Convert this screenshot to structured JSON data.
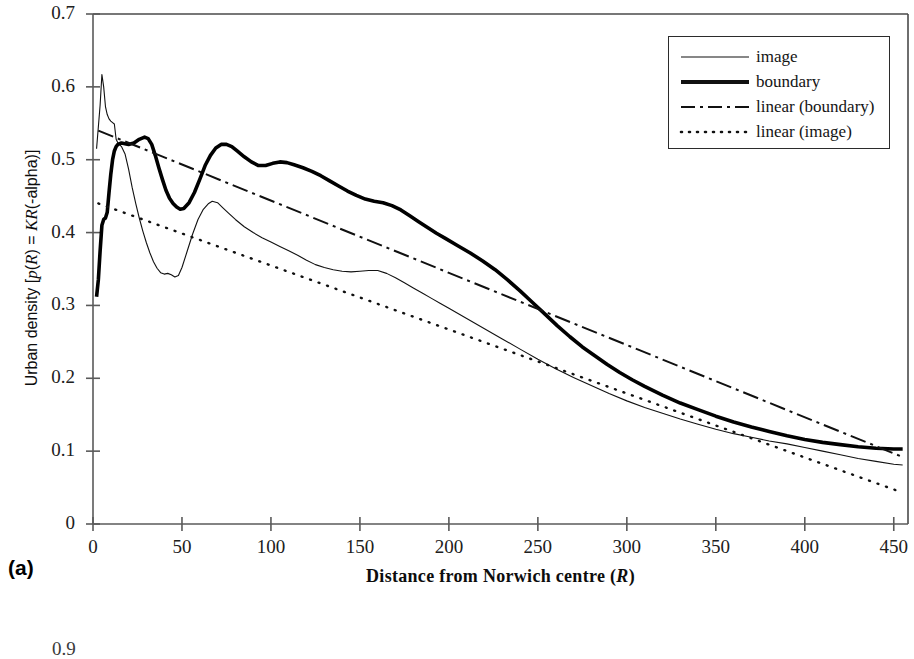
{
  "panel": {
    "label": "(a)"
  },
  "next_figure": {
    "partial_ytick": "0.9"
  },
  "axes": {
    "y_title_prefix": "Urban density [",
    "y_title_p": "p",
    "y_title_mid1": "(",
    "y_title_R1": "R",
    "y_title_mid2": ") = ",
    "y_title_K": "K",
    "y_title_R2": "R",
    "y_title_suffix": "(-alpha)]",
    "x_title_prefix": "Distance from Norwich centre (",
    "x_title_R": "R",
    "x_title_suffix": ")"
  },
  "legend": {
    "items": [
      {
        "label": "image",
        "style": "thin-solid"
      },
      {
        "label": "boundary",
        "style": "thick-solid"
      },
      {
        "label": "linear (boundary)",
        "style": "dash-dot"
      },
      {
        "label": "linear (image)",
        "style": "dotted"
      }
    ]
  },
  "chart_data": {
    "type": "line",
    "title": "",
    "subtitle": "",
    "xlabel": "Distance from Norwich centre (R)",
    "ylabel": "Urban density [p(R) = K R(-alpha)]",
    "xlim": [
      0,
      458
    ],
    "ylim": [
      0,
      0.7
    ],
    "xticks": [
      0,
      50,
      100,
      150,
      200,
      250,
      300,
      350,
      400,
      450
    ],
    "xtick_labels": [
      "0",
      "50",
      "100",
      "150",
      "200",
      "250",
      "300",
      "350",
      "400",
      "450"
    ],
    "yticks": [
      0,
      0.1,
      0.2,
      0.3,
      0.4,
      0.5,
      0.6,
      0.7
    ],
    "ytick_labels": [
      "0",
      "0.1",
      "0.2",
      "0.3",
      "0.4",
      "0.5",
      "0.6",
      "0.7"
    ],
    "grid": false,
    "legend_position": "top-right",
    "series": [
      {
        "name": "image",
        "style": "thin-solid",
        "color": "#111111",
        "width": 1.1,
        "points": [
          [
            2,
            0.515
          ],
          [
            3,
            0.545
          ],
          [
            4,
            0.575
          ],
          [
            5,
            0.617
          ],
          [
            6,
            0.6
          ],
          [
            7,
            0.573
          ],
          [
            8,
            0.562
          ],
          [
            9,
            0.556
          ],
          [
            10,
            0.553
          ],
          [
            11,
            0.551
          ],
          [
            12,
            0.549
          ],
          [
            13,
            0.528
          ],
          [
            14,
            0.523
          ],
          [
            16,
            0.518
          ],
          [
            18,
            0.508
          ],
          [
            20,
            0.487
          ],
          [
            22,
            0.462
          ],
          [
            24,
            0.44
          ],
          [
            26,
            0.42
          ],
          [
            28,
            0.402
          ],
          [
            30,
            0.386
          ],
          [
            32,
            0.372
          ],
          [
            34,
            0.36
          ],
          [
            36,
            0.351
          ],
          [
            38,
            0.345
          ],
          [
            40,
            0.343
          ],
          [
            42,
            0.344
          ],
          [
            44,
            0.342
          ],
          [
            46,
            0.339
          ],
          [
            48,
            0.341
          ],
          [
            50,
            0.352
          ],
          [
            53,
            0.375
          ],
          [
            56,
            0.398
          ],
          [
            59,
            0.418
          ],
          [
            62,
            0.432
          ],
          [
            65,
            0.44
          ],
          [
            67,
            0.443
          ],
          [
            70,
            0.441
          ],
          [
            73,
            0.434
          ],
          [
            76,
            0.427
          ],
          [
            80,
            0.418
          ],
          [
            85,
            0.408
          ],
          [
            90,
            0.4
          ],
          [
            95,
            0.393
          ],
          [
            100,
            0.387
          ],
          [
            105,
            0.381
          ],
          [
            110,
            0.375
          ],
          [
            115,
            0.369
          ],
          [
            120,
            0.362
          ],
          [
            125,
            0.356
          ],
          [
            130,
            0.352
          ],
          [
            135,
            0.349
          ],
          [
            140,
            0.347
          ],
          [
            145,
            0.346
          ],
          [
            150,
            0.347
          ],
          [
            155,
            0.348
          ],
          [
            160,
            0.348
          ],
          [
            165,
            0.344
          ],
          [
            170,
            0.338
          ],
          [
            175,
            0.331
          ],
          [
            180,
            0.324
          ],
          [
            185,
            0.317
          ],
          [
            190,
            0.31
          ],
          [
            195,
            0.303
          ],
          [
            200,
            0.296
          ],
          [
            210,
            0.282
          ],
          [
            220,
            0.268
          ],
          [
            230,
            0.254
          ],
          [
            240,
            0.24
          ],
          [
            250,
            0.226
          ],
          [
            260,
            0.213
          ],
          [
            270,
            0.201
          ],
          [
            280,
            0.19
          ],
          [
            290,
            0.179
          ],
          [
            300,
            0.169
          ],
          [
            310,
            0.16
          ],
          [
            320,
            0.152
          ],
          [
            330,
            0.144
          ],
          [
            340,
            0.137
          ],
          [
            350,
            0.13
          ],
          [
            360,
            0.124
          ],
          [
            370,
            0.119
          ],
          [
            380,
            0.114
          ],
          [
            390,
            0.11
          ],
          [
            400,
            0.105
          ],
          [
            410,
            0.1
          ],
          [
            420,
            0.095
          ],
          [
            430,
            0.09
          ],
          [
            440,
            0.086
          ],
          [
            450,
            0.082
          ],
          [
            455,
            0.081
          ]
        ]
      },
      {
        "name": "boundary",
        "style": "thick-solid",
        "color": "#000000",
        "width": 3.6,
        "points": [
          [
            2,
            0.312
          ],
          [
            3,
            0.335
          ],
          [
            4,
            0.375
          ],
          [
            5,
            0.41
          ],
          [
            6,
            0.418
          ],
          [
            7,
            0.42
          ],
          [
            8,
            0.428
          ],
          [
            9,
            0.455
          ],
          [
            10,
            0.48
          ],
          [
            11,
            0.5
          ],
          [
            12,
            0.512
          ],
          [
            13,
            0.518
          ],
          [
            14,
            0.521
          ],
          [
            16,
            0.523
          ],
          [
            18,
            0.522
          ],
          [
            20,
            0.521
          ],
          [
            23,
            0.523
          ],
          [
            26,
            0.528
          ],
          [
            29,
            0.531
          ],
          [
            31,
            0.529
          ],
          [
            33,
            0.521
          ],
          [
            35,
            0.506
          ],
          [
            37,
            0.489
          ],
          [
            39,
            0.473
          ],
          [
            41,
            0.458
          ],
          [
            43,
            0.447
          ],
          [
            45,
            0.44
          ],
          [
            47,
            0.435
          ],
          [
            49,
            0.432
          ],
          [
            51,
            0.433
          ],
          [
            54,
            0.441
          ],
          [
            57,
            0.455
          ],
          [
            60,
            0.473
          ],
          [
            63,
            0.492
          ],
          [
            66,
            0.506
          ],
          [
            69,
            0.516
          ],
          [
            72,
            0.521
          ],
          [
            75,
            0.521
          ],
          [
            78,
            0.518
          ],
          [
            81,
            0.512
          ],
          [
            85,
            0.504
          ],
          [
            89,
            0.497
          ],
          [
            93,
            0.492
          ],
          [
            97,
            0.492
          ],
          [
            101,
            0.495
          ],
          [
            105,
            0.497
          ],
          [
            109,
            0.496
          ],
          [
            113,
            0.493
          ],
          [
            118,
            0.489
          ],
          [
            123,
            0.484
          ],
          [
            128,
            0.478
          ],
          [
            133,
            0.471
          ],
          [
            138,
            0.464
          ],
          [
            143,
            0.457
          ],
          [
            148,
            0.451
          ],
          [
            153,
            0.446
          ],
          [
            158,
            0.443
          ],
          [
            163,
            0.441
          ],
          [
            168,
            0.437
          ],
          [
            173,
            0.431
          ],
          [
            178,
            0.423
          ],
          [
            183,
            0.415
          ],
          [
            188,
            0.407
          ],
          [
            193,
            0.399
          ],
          [
            198,
            0.392
          ],
          [
            205,
            0.382
          ],
          [
            212,
            0.372
          ],
          [
            219,
            0.361
          ],
          [
            226,
            0.349
          ],
          [
            233,
            0.335
          ],
          [
            240,
            0.32
          ],
          [
            247,
            0.304
          ],
          [
            254,
            0.288
          ],
          [
            261,
            0.272
          ],
          [
            268,
            0.257
          ],
          [
            275,
            0.243
          ],
          [
            282,
            0.231
          ],
          [
            289,
            0.219
          ],
          [
            296,
            0.208
          ],
          [
            303,
            0.198
          ],
          [
            310,
            0.189
          ],
          [
            320,
            0.177
          ],
          [
            330,
            0.166
          ],
          [
            340,
            0.157
          ],
          [
            350,
            0.148
          ],
          [
            360,
            0.14
          ],
          [
            370,
            0.133
          ],
          [
            380,
            0.127
          ],
          [
            390,
            0.121
          ],
          [
            400,
            0.116
          ],
          [
            410,
            0.112
          ],
          [
            420,
            0.109
          ],
          [
            430,
            0.106
          ],
          [
            440,
            0.104
          ],
          [
            450,
            0.103
          ],
          [
            455,
            0.103
          ]
        ]
      },
      {
        "name": "linear (boundary)",
        "style": "dash-dot",
        "color": "#101010",
        "width": 2.0,
        "points": [
          [
            3,
            0.54
          ],
          [
            455,
            0.092
          ]
        ]
      },
      {
        "name": "linear (image)",
        "style": "dotted",
        "color": "#101010",
        "width": 2.4,
        "points": [
          [
            3,
            0.44
          ],
          [
            455,
            0.043
          ]
        ]
      }
    ]
  }
}
